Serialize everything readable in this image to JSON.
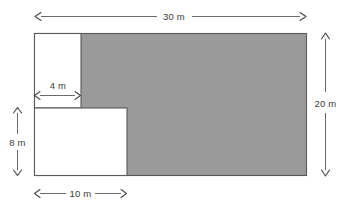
{
  "figure": {
    "background_color": "#ffffff",
    "shaded_color": "#9a9a9a",
    "unshaded_color": "#ffffff",
    "outline_color": "#5a5a5a",
    "dimension_line_color": "#6b6b6b",
    "label_color": "#3a3a3a"
  },
  "dimensions": {
    "overall_width": {
      "value": 30,
      "unit": "m",
      "label": "30 m",
      "position": "top"
    },
    "overall_height": {
      "value": 20,
      "unit": "m",
      "label": "20 m",
      "position": "right"
    },
    "upper_cutout_width": {
      "value": 4,
      "unit": "m",
      "label": "4 m",
      "position": "inside-upper-left"
    },
    "lower_cutout_height": {
      "value": 8,
      "unit": "m",
      "label": "8 m",
      "position": "left"
    },
    "lower_cutout_width": {
      "value": 10,
      "unit": "m",
      "label": "10 m",
      "position": "bottom"
    }
  },
  "shapes": {
    "outer_rectangle": {
      "name": "outer-rectangle",
      "width_label": "30 m",
      "height_label": "20 m"
    },
    "upper_left_cutout": {
      "name": "upper-left-white-rectangle",
      "width_label": "4 m"
    },
    "lower_left_cutout": {
      "name": "lower-left-white-rectangle",
      "width_label": "10 m",
      "height_label": "8 m"
    }
  },
  "labels": {
    "top": "30 m",
    "right": "20 m",
    "inner": "4 m",
    "left": "8 m",
    "bottom": "10 m"
  }
}
